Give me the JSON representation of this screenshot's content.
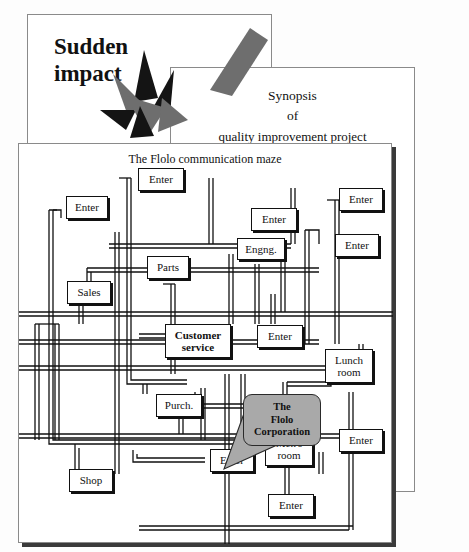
{
  "document": {
    "background_color": "#fdfdfd",
    "ink_color": "#111111",
    "accent_gray": "#a9a9a9"
  },
  "page1": {
    "name": "sudden-impact-page",
    "title_line1": "Sudden",
    "title_line2": "impact",
    "graphics": [
      "starburst-explosion",
      "gray-diagonal-bar"
    ]
  },
  "page2": {
    "name": "synopsis-page",
    "title_line1": "Synopsis",
    "title_line2": "of",
    "title_line3": "quality improvement project",
    "footer": {
      "brand": "SPICE",
      "line1": "orida Suncoast",
      "line2": ", Florida 34640",
      "line3": "32"
    }
  },
  "page3": {
    "name": "flolo-maze-page",
    "title": "The Flolo communication maze",
    "callout": {
      "line1": "The",
      "line2": "Flolo",
      "line3": "Corporation",
      "points_to": "Customer service",
      "fill": "#a9a9a9"
    },
    "nodes": [
      {
        "id": "enter-top-left",
        "label": "Enter",
        "x": 47,
        "y": 52,
        "w": 42,
        "h": 23,
        "bold": false
      },
      {
        "id": "enter-top-center",
        "label": "Enter",
        "x": 119,
        "y": 24,
        "w": 46,
        "h": 23,
        "bold": false
      },
      {
        "id": "enter-top-right",
        "label": "Enter",
        "x": 320,
        "y": 44,
        "w": 44,
        "h": 23,
        "bold": false
      },
      {
        "id": "enter-upper-mid",
        "label": "Enter",
        "x": 232,
        "y": 64,
        "w": 46,
        "h": 23,
        "bold": false
      },
      {
        "id": "enter-right-second",
        "label": "Enter",
        "x": 316,
        "y": 90,
        "w": 44,
        "h": 23,
        "bold": false
      },
      {
        "id": "engng",
        "label": "Engng.",
        "x": 218,
        "y": 94,
        "w": 48,
        "h": 22,
        "bold": false
      },
      {
        "id": "parts",
        "label": "Parts",
        "x": 128,
        "y": 112,
        "w": 42,
        "h": 23,
        "bold": false
      },
      {
        "id": "sales",
        "label": "Sales",
        "x": 48,
        "y": 137,
        "w": 44,
        "h": 23,
        "bold": false
      },
      {
        "id": "customer-service",
        "label": "Customer\nservice",
        "x": 146,
        "y": 180,
        "w": 66,
        "h": 34,
        "bold": true
      },
      {
        "id": "enter-center-right",
        "label": "Enter",
        "x": 238,
        "y": 181,
        "w": 46,
        "h": 23,
        "bold": false
      },
      {
        "id": "lunch-room",
        "label": "Lunch\nroom",
        "x": 306,
        "y": 205,
        "w": 48,
        "h": 34,
        "bold": false
      },
      {
        "id": "purch",
        "label": "Purch.",
        "x": 137,
        "y": 250,
        "w": 46,
        "h": 23,
        "bold": false
      },
      {
        "id": "enter-lower-left",
        "label": "Enter",
        "x": 191,
        "y": 305,
        "w": 44,
        "h": 23,
        "bold": false
      },
      {
        "id": "mens-room",
        "label": "Men's\nroom",
        "x": 246,
        "y": 288,
        "w": 48,
        "h": 34,
        "bold": false
      },
      {
        "id": "enter-lower-right",
        "label": "Enter",
        "x": 320,
        "y": 285,
        "w": 44,
        "h": 23,
        "bold": false
      },
      {
        "id": "shop",
        "label": "Shop",
        "x": 50,
        "y": 325,
        "w": 44,
        "h": 23,
        "bold": false
      },
      {
        "id": "enter-bottom-mid",
        "label": "Enter",
        "x": 249,
        "y": 350,
        "w": 46,
        "h": 23,
        "bold": false
      }
    ]
  }
}
